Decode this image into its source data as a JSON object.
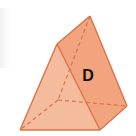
{
  "figure": {
    "shape": "triangular-prism",
    "label": "D",
    "colors": {
      "background": "#ffffff",
      "light_face": "#f6c9ae",
      "front_face": "#f2a47e",
      "right_face": "#ef9a72",
      "bottom_face": "#f0a27c",
      "edge": "#d8744a",
      "hidden_edge": "#d8744a",
      "label": "#111111"
    },
    "vertices": {
      "apex": [
        90,
        16
      ],
      "top_left": [
        57,
        44
      ],
      "bottom_left": [
        20,
        130
      ],
      "bottom_front": [
        100,
        130
      ],
      "right": [
        127,
        106
      ],
      "hidden_back": [
        58,
        100
      ]
    }
  }
}
